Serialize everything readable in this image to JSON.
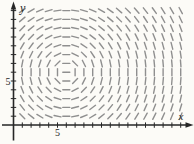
{
  "chart_data": {
    "type": "scatter",
    "subtype": "slope_field",
    "title": "",
    "xlabel": "x",
    "ylabel": "y",
    "x_tick_label": "5",
    "y_tick_label": "5",
    "x_tick_label_value": 5,
    "y_tick_label_value": 5,
    "xlim": [
      0,
      20.5
    ],
    "ylim": [
      0,
      14.5
    ],
    "x_tick_step": 1,
    "y_tick_step": 1,
    "x_tick_count": 19,
    "y_tick_count": 13,
    "grid": false,
    "legend": "none",
    "equation": "dy/dx = -(x - 6)/(y - 6)",
    "pattern": "short slope segments circulating in closed loops (clockwise) around the center; segments are horizontal along the vertical line x=6, vertical along the horizontal line y=6, slope -1 toward lower-left and upper-right, +1 toward lower-right and upper-left",
    "center": [
      6,
      6
    ],
    "mesh": {
      "x_start": 1,
      "x_end": 19,
      "y_start": 1,
      "y_end": 13,
      "step": 1
    },
    "colors": {
      "axis": "#262626",
      "marks": "#8f8f8f",
      "labels": "#262626"
    }
  }
}
